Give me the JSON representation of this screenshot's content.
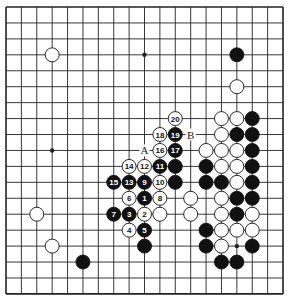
{
  "board": {
    "size": 19,
    "origin_x": 6,
    "origin_y": 7,
    "step_x": 15.39,
    "step_y": 15.94,
    "stone_radius": 7,
    "line_color": "#222222",
    "black_color": "#111111",
    "white_color": "#ffffff",
    "star_points": [
      [
        3,
        3
      ],
      [
        9,
        3
      ],
      [
        15,
        3
      ],
      [
        3,
        9
      ],
      [
        9,
        9
      ],
      [
        15,
        9
      ],
      [
        3,
        15
      ],
      [
        9,
        15
      ],
      [
        15,
        15
      ]
    ]
  },
  "stones": {
    "black": [
      [
        15,
        3
      ],
      [
        11,
        10
      ],
      [
        11,
        11
      ],
      [
        9,
        15
      ],
      [
        5,
        16
      ],
      [
        16,
        7
      ],
      [
        15,
        8
      ],
      [
        16,
        8
      ],
      [
        16,
        9
      ],
      [
        13,
        10
      ],
      [
        16,
        10
      ],
      [
        13,
        11
      ],
      [
        14,
        11
      ],
      [
        16,
        11
      ],
      [
        15,
        12
      ],
      [
        16,
        12
      ],
      [
        15,
        13
      ],
      [
        13,
        14
      ],
      [
        13,
        15
      ],
      [
        16,
        15
      ],
      [
        14,
        16
      ],
      [
        15,
        16
      ]
    ],
    "white": [
      [
        3,
        3
      ],
      [
        15,
        5
      ],
      [
        2,
        13
      ],
      [
        3,
        15
      ],
      [
        10,
        13
      ],
      [
        12,
        12
      ],
      [
        12,
        13
      ],
      [
        14,
        7
      ],
      [
        15,
        7
      ],
      [
        14,
        8
      ],
      [
        13,
        9
      ],
      [
        14,
        9
      ],
      [
        15,
        9
      ],
      [
        14,
        10
      ],
      [
        15,
        10
      ],
      [
        15,
        11
      ],
      [
        14,
        12
      ],
      [
        14,
        13
      ],
      [
        16,
        13
      ],
      [
        14,
        14
      ],
      [
        15,
        14
      ],
      [
        16,
        14
      ],
      [
        14,
        15
      ]
    ]
  },
  "moves": [
    {
      "n": "1",
      "color": "black",
      "x": 9,
      "y": 12
    },
    {
      "n": "2",
      "color": "white",
      "x": 9,
      "y": 13
    },
    {
      "n": "3",
      "color": "black",
      "x": 8,
      "y": 13
    },
    {
      "n": "4",
      "color": "white",
      "x": 8,
      "y": 14
    },
    {
      "n": "5",
      "color": "black",
      "x": 9,
      "y": 14
    },
    {
      "n": "6",
      "color": "white",
      "x": 8,
      "y": 12
    },
    {
      "n": "7",
      "color": "black",
      "x": 7,
      "y": 13
    },
    {
      "n": "8",
      "color": "white",
      "x": 10,
      "y": 12
    },
    {
      "n": "9",
      "color": "black",
      "x": 9,
      "y": 11
    },
    {
      "n": "10",
      "color": "white",
      "x": 10,
      "y": 11
    },
    {
      "n": "11",
      "color": "black",
      "x": 10,
      "y": 10
    },
    {
      "n": "12",
      "color": "white",
      "x": 9,
      "y": 10
    },
    {
      "n": "13",
      "color": "black",
      "x": 8,
      "y": 11
    },
    {
      "n": "14",
      "color": "white",
      "x": 8,
      "y": 10
    },
    {
      "n": "15",
      "color": "black",
      "x": 7,
      "y": 11
    },
    {
      "n": "16",
      "color": "white",
      "x": 10,
      "y": 9
    },
    {
      "n": "17",
      "color": "black",
      "x": 11,
      "y": 9
    },
    {
      "n": "18",
      "color": "white",
      "x": 10,
      "y": 8
    },
    {
      "n": "19",
      "color": "black",
      "x": 11,
      "y": 8
    },
    {
      "n": "20",
      "color": "white",
      "x": 11,
      "y": 7
    }
  ],
  "labels": [
    {
      "text": "A",
      "x": 9,
      "y": 9
    },
    {
      "text": "B",
      "x": 12,
      "y": 8
    }
  ]
}
